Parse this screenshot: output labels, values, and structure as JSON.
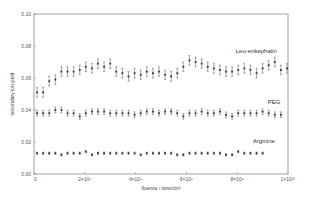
{
  "chart_data": {
    "type": "scatter",
    "title": "",
    "xlabel": "fluence / ions/cm²",
    "ylabel": "secondary ion yield",
    "xlim": [
      0,
      10000000000
    ],
    "ylim": [
      0.0,
      0.1
    ],
    "grid": false,
    "legend_position": "inline labels at right",
    "x_ticks": [
      {
        "value": 0,
        "label": "0"
      },
      {
        "value": 2000000000,
        "label": "2×10⁹"
      },
      {
        "value": 4000000000,
        "label": "4×10⁹"
      },
      {
        "value": 6000000000,
        "label": "6×10⁹"
      },
      {
        "value": 8000000000,
        "label": "8×10⁹"
      },
      {
        "value": 10000000000,
        "label": "1×10¹⁰"
      }
    ],
    "y_ticks": [
      {
        "value": 0.0,
        "label": "0.00"
      },
      {
        "value": 0.02,
        "label": "0.02"
      },
      {
        "value": 0.04,
        "label": "0.04"
      },
      {
        "value": 0.06,
        "label": "0.06"
      },
      {
        "value": 0.08,
        "label": "0.08"
      },
      {
        "value": 0.1,
        "label": "0.10"
      }
    ],
    "x_start": 120000000,
    "x_step": 240000000,
    "series": [
      {
        "name": "Leu-enkephalin",
        "label_pos": {
          "x": 8750000000,
          "y": 0.0755
        },
        "error": 0.003,
        "values": [
          0.051,
          0.051,
          0.058,
          0.059,
          0.064,
          0.064,
          0.064,
          0.065,
          0.067,
          0.066,
          0.069,
          0.067,
          0.069,
          0.064,
          0.063,
          0.061,
          0.063,
          0.062,
          0.064,
          0.063,
          0.064,
          0.062,
          0.061,
          0.063,
          0.067,
          0.071,
          0.07,
          0.069,
          0.067,
          0.066,
          0.065,
          0.064,
          0.064,
          0.065,
          0.066,
          0.065,
          0.063,
          0.066,
          0.068,
          0.07,
          0.065,
          0.066
        ]
      },
      {
        "name": "PEG",
        "label_pos": {
          "x": 9450000000,
          "y": 0.0435
        },
        "error": 0.0018,
        "values": [
          0.038,
          0.038,
          0.038,
          0.04,
          0.04,
          0.038,
          0.038,
          0.036,
          0.038,
          0.039,
          0.039,
          0.039,
          0.038,
          0.038,
          0.038,
          0.038,
          0.037,
          0.038,
          0.039,
          0.039,
          0.038,
          0.039,
          0.039,
          0.038,
          0.036,
          0.038,
          0.038,
          0.039,
          0.038,
          0.038,
          0.039,
          0.037,
          0.036,
          0.038,
          0.038,
          0.038,
          0.038,
          0.039,
          0.038,
          0.037,
          0.037
        ]
      },
      {
        "name": "Arginine",
        "label_pos": {
          "x": 9050000000,
          "y": 0.0195
        },
        "error": 0.0007,
        "values": [
          0.013,
          0.013,
          0.013,
          0.013,
          0.012,
          0.013,
          0.013,
          0.013,
          0.014,
          0.012,
          0.013,
          0.013,
          0.013,
          0.013,
          0.013,
          0.013,
          0.013,
          0.012,
          0.013,
          0.013,
          0.013,
          0.013,
          0.013,
          0.012,
          0.012,
          0.013,
          0.013,
          0.013,
          0.013,
          0.013,
          0.013,
          0.012,
          0.012,
          0.014,
          0.013,
          0.013,
          0.013,
          0.013
        ]
      }
    ]
  }
}
